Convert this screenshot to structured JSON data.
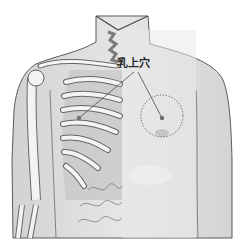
{
  "figure": {
    "acupoint_label": "乳上穴",
    "colors": {
      "skin": "#dcdcdc",
      "skin_light": "#ececec",
      "outline": "#5a5a5a",
      "bone": "#f4f4f4",
      "muscle": "#b9b9b9",
      "point": "#6e6e6e",
      "leader_line": "#4a4a4a",
      "dashed_circle": "#555555"
    },
    "markers": [
      {
        "name": "right-chest-point",
        "x": 162,
        "y": 118
      },
      {
        "name": "left-rib-point",
        "x": 79,
        "y": 118
      }
    ],
    "highlight_circle": {
      "cx": 162,
      "cy": 116,
      "r": 21
    }
  }
}
